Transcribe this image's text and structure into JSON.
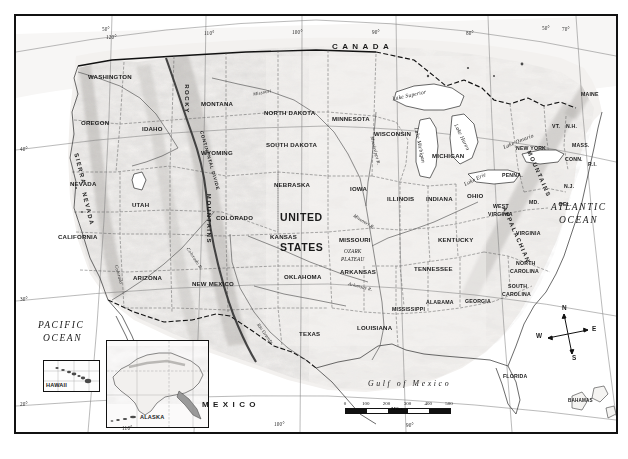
{
  "map": {
    "title": "United States — Physical and Political Reference Map",
    "projection_note": "conic, curved graticule",
    "countries": [
      {
        "name": "CANADA",
        "x": 330,
        "y": 44
      },
      {
        "name": "MEXICO",
        "x": 200,
        "y": 402
      }
    ],
    "country_big_lines": [
      {
        "text": "UNITED",
        "x": 280,
        "y": 213
      },
      {
        "text": "STATES",
        "x": 280,
        "y": 243
      }
    ],
    "oceans": [
      {
        "name": "PACIFIC",
        "x": 38,
        "y": 326
      },
      {
        "name": "OCEAN",
        "x": 42,
        "y": 339
      },
      {
        "name": "ATLANTIC",
        "x": 560,
        "y": 208
      },
      {
        "name": "OCEAN",
        "x": 566,
        "y": 221
      }
    ],
    "gulf": {
      "name": "Gulf of Mexico",
      "x": 383,
      "y": 381
    },
    "states": [
      {
        "name": "WASHINGTON",
        "x": 97,
        "y": 68
      },
      {
        "name": "OREGON",
        "x": 84,
        "y": 114
      },
      {
        "name": "IDAHO",
        "x": 140,
        "y": 120
      },
      {
        "name": "MONTANA",
        "x": 207,
        "y": 95
      },
      {
        "name": "NORTH DAKOTA",
        "x": 281,
        "y": 104
      },
      {
        "name": "SOUTH DAKOTA",
        "x": 283,
        "y": 136
      },
      {
        "name": "MINNESOTA",
        "x": 343,
        "y": 110
      },
      {
        "name": "WISCONSIN",
        "x": 383,
        "y": 125
      },
      {
        "name": "MICHIGAN",
        "x": 438,
        "y": 147
      },
      {
        "name": "WYOMING",
        "x": 207,
        "y": 144
      },
      {
        "name": "NEVADA",
        "x": 72,
        "y": 175
      },
      {
        "name": "UTAH",
        "x": 128,
        "y": 196
      },
      {
        "name": "COLORADO",
        "x": 226,
        "y": 209
      },
      {
        "name": "NEBRASKA",
        "x": 285,
        "y": 176
      },
      {
        "name": "IOWA",
        "x": 348,
        "y": 180
      },
      {
        "name": "ILLINOIS",
        "x": 392,
        "y": 190
      },
      {
        "name": "INDIANA",
        "x": 430,
        "y": 190
      },
      {
        "name": "OHIO",
        "x": 464,
        "y": 187
      },
      {
        "name": "KANSAS",
        "x": 277,
        "y": 228
      },
      {
        "name": "MISSOURI",
        "x": 345,
        "y": 231
      },
      {
        "name": "KENTUCKY",
        "x": 446,
        "y": 231
      },
      {
        "name": "CALIFORNIA",
        "x": 67,
        "y": 228
      },
      {
        "name": "ARIZONA",
        "x": 136,
        "y": 269
      },
      {
        "name": "NEW MEXICO",
        "x": 209,
        "y": 275
      },
      {
        "name": "OKLAHOMA",
        "x": 296,
        "y": 268
      },
      {
        "name": "ARKANSAS",
        "x": 347,
        "y": 263
      },
      {
        "name": "TENNESSEE",
        "x": 426,
        "y": 260
      },
      {
        "name": "TEXAS",
        "x": 297,
        "y": 325
      },
      {
        "name": "LOUISIANA",
        "x": 364,
        "y": 319
      },
      {
        "name": "MISSISSIPPI",
        "x": 398,
        "y": 300
      },
      {
        "name": "ALABAMA",
        "x": 428,
        "y": 293
      },
      {
        "name": "GEORGIA",
        "x": 467,
        "y": 292
      },
      {
        "name": "FLORIDA",
        "x": 504,
        "y": 367
      },
      {
        "name": "NEW YORK",
        "x": 521,
        "y": 139
      },
      {
        "name": "PENNA.",
        "x": 502,
        "y": 166
      },
      {
        "name": "VIRGINIA",
        "x": 518,
        "y": 224
      },
      {
        "name": "MAINE",
        "x": 581,
        "y": 85
      },
      {
        "name": "MASS.",
        "x": 570,
        "y": 136
      }
    ],
    "states_two_line": [
      {
        "line1": "WEST",
        "line2": "VIRGINIA",
        "x": 489,
        "y": 198
      },
      {
        "line1": "NORTH",
        "line2": "CAROLINA",
        "x": 511,
        "y": 252
      },
      {
        "line1": "SOUTH",
        "line2": "CAROLINA",
        "x": 502,
        "y": 275
      }
    ],
    "abbreviations": [
      {
        "name": "VT.",
        "x": 548,
        "y": 114
      },
      {
        "name": "N.H.",
        "x": 563,
        "y": 114
      },
      {
        "name": "CONN.",
        "x": 563,
        "y": 147
      },
      {
        "name": "R.I.",
        "x": 583,
        "y": 152
      },
      {
        "name": "N.J.",
        "x": 559,
        "y": 176
      },
      {
        "name": "DEL.",
        "x": 554,
        "y": 194
      },
      {
        "name": "MD.",
        "x": 527,
        "y": 192
      }
    ],
    "lakes": [
      {
        "name": "Lake Superior",
        "x": 411,
        "y": 88,
        "rotate": -10
      },
      {
        "name": "Lake Michigan",
        "x": 413,
        "y": 138,
        "rotate": 76
      },
      {
        "name": "Lake Huron",
        "x": 453,
        "y": 127,
        "rotate": 62
      },
      {
        "name": "Lake Erie",
        "x": 473,
        "y": 168,
        "rotate": -28
      },
      {
        "name": "Lake Ontario",
        "x": 505,
        "y": 129,
        "rotate": -20
      }
    ],
    "rivers": [
      {
        "name": "Missouri",
        "x": 253,
        "y": 80,
        "rotate": -10
      },
      {
        "name": "Mississippi R.",
        "x": 367,
        "y": 147,
        "rotate": 73
      },
      {
        "name": "Missouri R.",
        "x": 359,
        "y": 210,
        "rotate": 34
      },
      {
        "name": "Arkansas R.",
        "x": 356,
        "y": 274,
        "rotate": 12
      },
      {
        "name": "Colorado",
        "x": 107,
        "y": 265,
        "rotate": 72
      },
      {
        "name": "Colorado R.",
        "x": 184,
        "y": 247,
        "rotate": 55
      },
      {
        "name": "Rio Grande",
        "x": 256,
        "y": 322,
        "rotate": 52
      }
    ],
    "ranges": [
      {
        "name": "ROCKY",
        "x": 176,
        "y": 92,
        "rotate": 90
      },
      {
        "name": "MOUNTAINS",
        "x": 198,
        "y": 215,
        "rotate": 90
      },
      {
        "name": "SIERRA",
        "x": 64,
        "y": 160,
        "rotate": 74
      },
      {
        "name": "NEVADA",
        "x": 72,
        "y": 200,
        "rotate": 74
      },
      {
        "name": "APPALACHIAN",
        "x": 500,
        "y": 228,
        "rotate": 66
      },
      {
        "name": "MOUNTAINS",
        "x": 524,
        "y": 166,
        "rotate": 66
      }
    ],
    "divide": {
      "name": "CONTINENTAL DIVIDE",
      "x": 196,
      "y": 152,
      "rotate": 74
    },
    "physiographic": [
      {
        "line1": "OZARK",
        "line2": "PLATEAU",
        "x": 345,
        "y": 246
      }
    ],
    "islands": [
      {
        "name": "BAHAMAS",
        "x": 572,
        "y": 400
      },
      {
        "name": "CUBA",
        "x": 521,
        "y": 437
      }
    ],
    "insets": [
      {
        "name": "HAWAII",
        "label_x": 44,
        "label_y": 383,
        "x": 41,
        "y": 358,
        "w": 55,
        "h": 30
      },
      {
        "name": "ALASKA",
        "label_x": 138,
        "label_y": 415,
        "x": 104,
        "y": 338,
        "w": 101,
        "h": 86
      }
    ],
    "graticule_labels": [
      {
        "text": "50°",
        "x": 103,
        "y": 28
      },
      {
        "text": "120°",
        "x": 108,
        "y": 36
      },
      {
        "text": "110°",
        "x": 205,
        "y": 32
      },
      {
        "text": "100°",
        "x": 294,
        "y": 31
      },
      {
        "text": "90°",
        "x": 372,
        "y": 31
      },
      {
        "text": "80°",
        "x": 466,
        "y": 32
      },
      {
        "text": "50°",
        "x": 543,
        "y": 27
      },
      {
        "text": "70°",
        "x": 563,
        "y": 28
      },
      {
        "text": "40°",
        "x": 22,
        "y": 148
      },
      {
        "text": "30°",
        "x": 22,
        "y": 298
      },
      {
        "text": "20°",
        "x": 22,
        "y": 403
      },
      {
        "text": "110°",
        "x": 123,
        "y": 427
      },
      {
        "text": "100°",
        "x": 275,
        "y": 423
      },
      {
        "text": "90°",
        "x": 405,
        "y": 424
      }
    ],
    "compass": {
      "x": 552,
      "y": 318,
      "north": "N",
      "south": "S",
      "east": "E",
      "west": "W"
    },
    "scale_bar": {
      "ticks": [
        "0",
        "100",
        "200",
        "300",
        "400",
        "500"
      ],
      "unit": "Miles"
    },
    "colors": {
      "frame": "#111111",
      "land": "#f2f0ee",
      "relief": "#bfbcb8",
      "water": "#ffffff",
      "border_state": "#4a4a4a",
      "border_country": "#111111",
      "text": "#1a1a1a"
    }
  }
}
